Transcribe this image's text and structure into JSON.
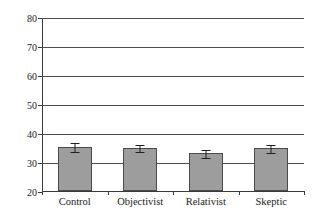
{
  "chart_data": {
    "type": "bar",
    "title": "",
    "xlabel": "",
    "ylabel": "Mean State Anxiety",
    "categories": [
      "Control",
      "Objectivist",
      "Relativist",
      "Skeptic"
    ],
    "values": [
      35.2,
      34.8,
      33.0,
      34.7
    ],
    "errors": [
      1.6,
      1.4,
      1.5,
      1.6
    ],
    "ylim": [
      20,
      80
    ],
    "yticks": [
      20,
      30,
      40,
      50,
      60,
      70,
      80
    ],
    "ytick_labels": [
      "20",
      "30",
      "40",
      "50",
      "60",
      "70",
      "80"
    ],
    "grid": true,
    "grid_axis": "y",
    "legend": false,
    "bar_color": "#9d9d9d",
    "bar_edge_color": "#4a4a4a",
    "error_color": "#1f1f1f",
    "axis_color": "#3a3a3a",
    "grid_color": "#4d4d4d",
    "background": "#ffffff"
  }
}
